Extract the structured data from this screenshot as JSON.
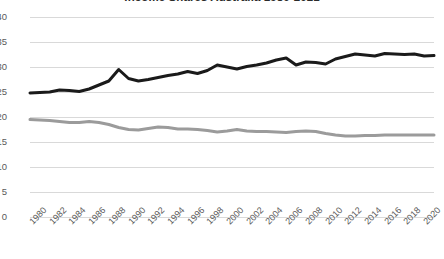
{
  "chart_data": {
    "type": "line",
    "title": "Income Shares Australia 1980-2021",
    "xlabel": "",
    "ylabel": "",
    "ylim": [
      0,
      40
    ],
    "ytick_step": 5,
    "yticks": [
      40,
      35,
      30,
      25,
      20,
      15,
      10,
      5,
      0
    ],
    "grid": true,
    "legend": "none",
    "xlim": [
      1980,
      2021
    ],
    "xtick_step": 2,
    "xticks": [
      1980,
      1982,
      1984,
      1986,
      1988,
      1990,
      1992,
      1994,
      1996,
      1998,
      2000,
      2002,
      2004,
      2006,
      2008,
      2010,
      2012,
      2014,
      2016,
      2018,
      2020
    ],
    "x": [
      1980,
      1981,
      1982,
      1983,
      1984,
      1985,
      1986,
      1987,
      1988,
      1989,
      1990,
      1991,
      1992,
      1993,
      1994,
      1995,
      1996,
      1997,
      1998,
      1999,
      2000,
      2001,
      2002,
      2003,
      2004,
      2005,
      2006,
      2007,
      2008,
      2009,
      2010,
      2011,
      2012,
      2013,
      2014,
      2015,
      2016,
      2017,
      2018,
      2019,
      2020,
      2021
    ],
    "series": [
      {
        "name": "Top 10% income share",
        "color": "#1a1a1a",
        "width": 3,
        "values": [
          24.8,
          24.9,
          25.0,
          25.4,
          25.3,
          25.1,
          25.6,
          26.4,
          27.2,
          29.5,
          27.7,
          27.2,
          27.5,
          27.9,
          28.3,
          28.6,
          29.1,
          28.7,
          29.3,
          30.4,
          30.0,
          29.6,
          30.1,
          30.4,
          30.8,
          31.4,
          31.8,
          30.4,
          31.0,
          30.9,
          30.6,
          31.6,
          32.1,
          32.6,
          32.4,
          32.2,
          32.7,
          32.6,
          32.5,
          32.6,
          32.2,
          32.3
        ]
      },
      {
        "name": "Bottom 50% income share",
        "color": "#9b9b9b",
        "width": 3,
        "values": [
          19.5,
          19.4,
          19.3,
          19.1,
          18.9,
          18.9,
          19.1,
          18.9,
          18.5,
          17.9,
          17.5,
          17.4,
          17.7,
          18.0,
          17.9,
          17.6,
          17.6,
          17.5,
          17.3,
          17.0,
          17.2,
          17.5,
          17.2,
          17.1,
          17.1,
          17.0,
          16.9,
          17.1,
          17.2,
          17.1,
          16.7,
          16.4,
          16.2,
          16.2,
          16.3,
          16.3,
          16.4,
          16.4,
          16.4,
          16.4,
          16.4,
          16.4
        ]
      }
    ]
  }
}
